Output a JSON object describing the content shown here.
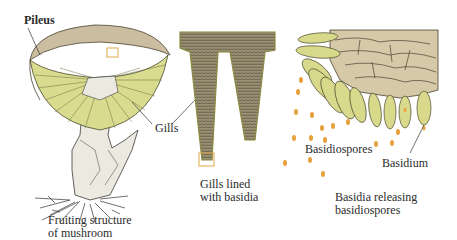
{
  "figure": {
    "panels": [
      {
        "id": "mushroom",
        "caption": [
          "Fruiting structure",
          "of mushroom"
        ]
      },
      {
        "id": "gills",
        "caption": [
          "Gills lined",
          "with basidia"
        ]
      },
      {
        "id": "basidia",
        "caption": [
          "Basidia releasing",
          "basidiospores"
        ]
      }
    ],
    "labels": {
      "pileus": "Pileus",
      "gills": "Gills",
      "basidiospores": "Basidiospores",
      "basidium": "Basidium"
    },
    "colors": {
      "cap_top": "#cbbd9f",
      "gill_yellow": "#d9dc8f",
      "gill_line": "#6e6a3a",
      "stalk": "#ecebe0",
      "hymenium_tissue": "#d6c9a8",
      "basidium_fill": "#d8d98a",
      "spore": "#e8a13a",
      "highlight_box": "#e0a84a",
      "gill_section": "#8d8566"
    }
  }
}
